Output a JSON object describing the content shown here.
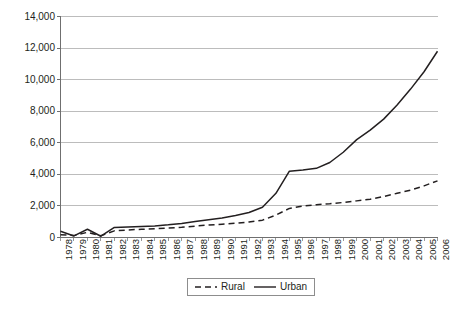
{
  "chart_data": {
    "type": "line",
    "title": "",
    "subtitle": "",
    "xlabel": "",
    "ylabel": "",
    "grid": "horizontal",
    "legend_position": "bottom-center",
    "ylim": [
      0,
      14000
    ],
    "yticks": [
      0,
      2000,
      4000,
      6000,
      8000,
      10000,
      12000,
      14000
    ],
    "ytick_labels": [
      "0",
      "2,000",
      "4,000",
      "6,000",
      "8,000",
      "10,000",
      "12,000",
      "14,000"
    ],
    "categories": [
      "1978",
      "1979",
      "1980",
      "1981",
      "1982",
      "1983",
      "1984",
      "1985",
      "1986",
      "1987",
      "1988",
      "1989",
      "1990",
      "1991",
      "1992",
      "1993",
      "1994",
      "1995",
      "1996",
      "1997",
      "1998",
      "1999",
      "2000",
      "2001",
      "2002",
      "2003",
      "2004",
      "2005",
      "2006"
    ],
    "series": [
      {
        "name": "Rural",
        "style": "dashed",
        "color": "#231f20",
        "values": [
          180,
          120,
          330,
          110,
          420,
          480,
          520,
          560,
          600,
          650,
          720,
          790,
          840,
          900,
          980,
          1100,
          1420,
          1840,
          1990,
          2080,
          2140,
          2220,
          2320,
          2420,
          2600,
          2800,
          3000,
          3270,
          3590
        ]
      },
      {
        "name": "Urban",
        "style": "solid",
        "color": "#231f20",
        "values": [
          400,
          100,
          520,
          80,
          640,
          660,
          690,
          730,
          800,
          890,
          1010,
          1120,
          1240,
          1390,
          1580,
          1920,
          2800,
          4200,
          4280,
          4380,
          4750,
          5400,
          6200,
          6800,
          7500,
          8400,
          9400,
          10500,
          11800
        ]
      }
    ]
  },
  "legend": {
    "entries": [
      {
        "label": "Rural",
        "style": "dashed"
      },
      {
        "label": "Urban",
        "style": "solid"
      }
    ]
  },
  "caption": {
    "text": ""
  }
}
